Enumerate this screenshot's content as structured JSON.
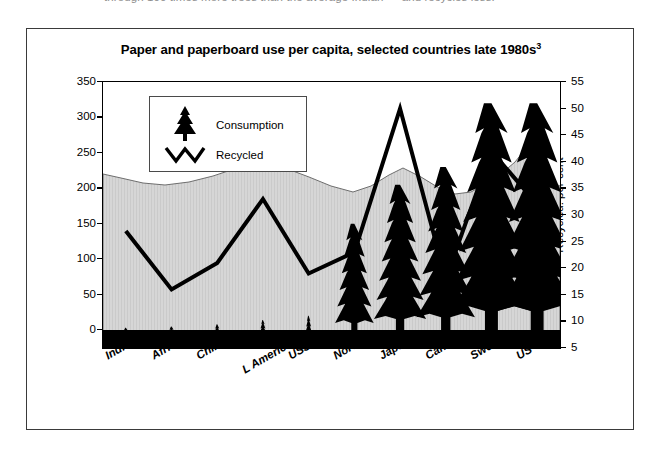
{
  "caption_cut": "through 100 times more trees than the average Indian — and recycles less.",
  "figure": {
    "title_main": "Paper and paperboard use per capita, selected countries late 1980s",
    "title_sup": "3"
  },
  "legend": {
    "consumption_label": "Consumption",
    "recycled_label": "Recycled",
    "consumption_icon": "fir-tree-icon",
    "recycled_icon": "zigzag-line-icon"
  },
  "colors": {
    "ink": "#000000",
    "frame": "#3a3a3a",
    "backdrop_fill": "#d3d3d3",
    "backdrop_stroke": "#6e6e6e",
    "page": "#ffffff"
  },
  "chart_data": {
    "type": "line",
    "title": "Paper and paperboard use per capita, selected countries late 1980s",
    "xlabel": "",
    "ylabel": "Consumption: kilograms per year",
    "y2label": "Recycled: per cent",
    "ylim": [
      0,
      350
    ],
    "y2lim": [
      5,
      55
    ],
    "yticks": [
      0,
      50,
      100,
      150,
      200,
      250,
      300,
      350
    ],
    "y2ticks": [
      5,
      10,
      15,
      20,
      25,
      30,
      35,
      40,
      45,
      50,
      55
    ],
    "grid": false,
    "legend_position": "upper-left-inset",
    "categories": [
      "India",
      "Africa",
      "China",
      "L America",
      "USSR",
      "Norway",
      "Japan",
      "Canada",
      "Sweden",
      "US"
    ],
    "series": [
      {
        "name": "Consumption",
        "unit": "kilograms per year",
        "axis": "left",
        "marker": "fir-tree",
        "values": [
          3,
          5,
          8,
          14,
          20,
          150,
          205,
          230,
          320,
          320
        ]
      },
      {
        "name": "Recycled",
        "unit": "per cent",
        "axis": "right",
        "marker": "line",
        "values": [
          27,
          16,
          21,
          33,
          19,
          23,
          50,
          18,
          42,
          32
        ]
      }
    ]
  }
}
